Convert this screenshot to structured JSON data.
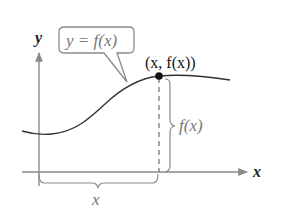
{
  "diagram": {
    "type": "function-graph-illustration",
    "axes": {
      "x_label": "x",
      "y_label": "y"
    },
    "callout": {
      "label": "y = f(x)"
    },
    "point": {
      "label": "(x, f(x))"
    },
    "vertical_brace": {
      "label": "f(x)"
    },
    "horizontal_brace": {
      "label": "x"
    },
    "colors": {
      "axis": "#8a8a8a",
      "curve": "#333333",
      "point": "#111111",
      "dashed": "#777777",
      "brace": "#8a8a8a",
      "callout_border": "#8a8a8a"
    }
  }
}
